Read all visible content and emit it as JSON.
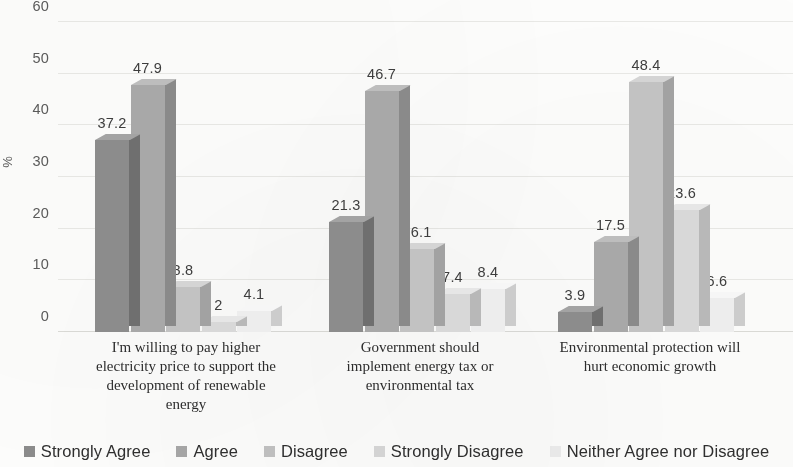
{
  "chart_data": {
    "type": "bar",
    "title": "",
    "subtitle": "",
    "xlabel": "",
    "ylabel": "%",
    "ylim": [
      0,
      60
    ],
    "yticks": [
      0,
      10,
      20,
      30,
      40,
      50,
      60
    ],
    "ytick_labels": [
      "0",
      "10",
      "20",
      "30",
      "40",
      "50",
      "60"
    ],
    "grid": true,
    "three_d": true,
    "legend_position": "bottom",
    "categories": [
      "I'm willing to pay higher electricity price to support the development of renewable energy",
      "Government should implement energy tax or environmental tax",
      "Environmental protection will hurt economic growth"
    ],
    "category_lines": [
      [
        "I'm willing to pay higher",
        "electricity price to support the",
        "development of renewable",
        "energy"
      ],
      [
        "Government should",
        "implement energy tax or",
        "environmental tax"
      ],
      [
        "Environmental protection will",
        "hurt economic growth"
      ]
    ],
    "series": [
      {
        "name": "Strongly Agree",
        "color": "#8c8c8c",
        "top_color": "#a3a3a3",
        "side_color": "#6f6f6f",
        "values": [
          37.2,
          21.3,
          3.9
        ],
        "labels": [
          "37.2",
          "21.3",
          "3.9"
        ]
      },
      {
        "name": "Agree",
        "color": "#a8a8a8",
        "top_color": "#bdbdbd",
        "side_color": "#8a8a8a",
        "values": [
          47.9,
          46.7,
          17.5
        ],
        "labels": [
          "47.9",
          "46.7",
          "17.5"
        ]
      },
      {
        "name": "Disagree",
        "color": "#c2c2c2",
        "top_color": "#d4d4d4",
        "side_color": "#a2a2a2",
        "values": [
          8.8,
          16.1,
          48.4
        ],
        "labels": [
          "8.8",
          "16.1",
          "48.4"
        ]
      },
      {
        "name": "Strongly Disagree",
        "color": "#d8d8d8",
        "top_color": "#e6e6e6",
        "side_color": "#b8b8b8",
        "values": [
          2.0,
          7.4,
          23.6
        ],
        "labels": [
          "2",
          "7.4",
          "23.6"
        ]
      },
      {
        "name": "Neither Agree nor Disagree",
        "color": "#ededed",
        "top_color": "#f6f6f6",
        "side_color": "#cccccc",
        "values": [
          4.1,
          8.4,
          6.6
        ],
        "labels": [
          "4.1",
          "8.4",
          "6.6"
        ]
      }
    ]
  },
  "legend": {
    "items": [
      "Strongly Agree",
      "Agree",
      "Disagree",
      "Strongly Disagree",
      "Neither Agree nor Disagree"
    ]
  }
}
